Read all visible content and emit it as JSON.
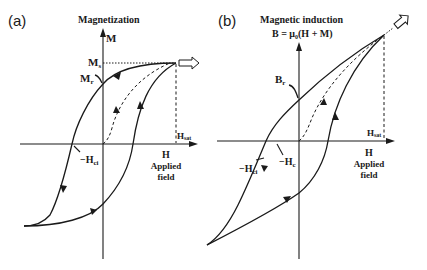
{
  "panel_a": {
    "label": "(a)",
    "y_axis_title": "Magnetization",
    "y_axis_symbol": "M",
    "saturation_label": "M",
    "saturation_sub": "s",
    "remanence_label": "M",
    "remanence_sub": "r",
    "coercivity_label": "−H",
    "coercivity_sub": "ci",
    "hsat_label": "H",
    "hsat_sub": "sat",
    "x_axis_symbol": "H",
    "x_axis_title_line1": "Applied",
    "x_axis_title_line2": "field"
  },
  "panel_b": {
    "label": "(b)",
    "y_axis_title": "Magnetic induction",
    "y_axis_formula": "B = μ₀(H + M)",
    "remanence_label": "B",
    "remanence_sub": "r",
    "intrinsic_coercivity_label": "−H",
    "intrinsic_coercivity_sub": "ci",
    "coercivity_label": "−H",
    "coercivity_sub": "c",
    "hsat_label": "H",
    "hsat_sub": "sat",
    "x_axis_symbol": "H",
    "x_axis_title_line1": "Applied",
    "x_axis_title_line2": "field"
  },
  "colors": {
    "ink": "#1a1a1a",
    "background": "#ffffff"
  }
}
